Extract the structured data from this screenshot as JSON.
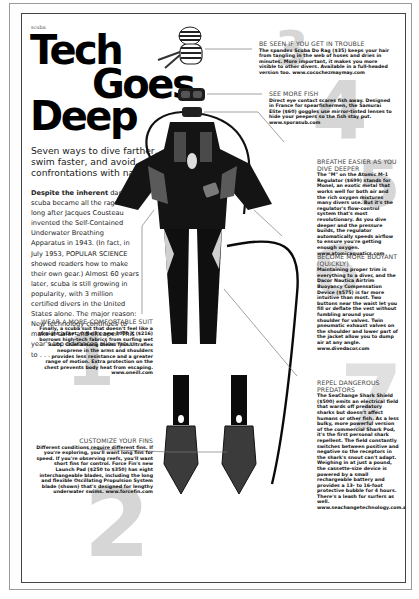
{
  "page": {
    "kicker": "scuba",
    "title_lines": [
      "Tech",
      "Goes",
      "Deep"
    ],
    "deck": "Seven ways to dive farther, swim faster, and avoid confrontations with nature.",
    "intro": {
      "lead": "Despite the inherent",
      "body": " danger, scuba became all the rage not long after Jacques Cousteau invented the Self-Contained Underwater Breathing Apparatus in 1943. (In fact, in July 1953, POPULAR SCIENCE showed readers how to make their own gear.) Almost 60 years later, scuba is still growing in popularity, with 3 million certified divers in the United States alone. The major reason: New technology continues to make it safer and cheaper. This year's top advances allow you to . . ."
    }
  },
  "items": [
    {
      "number": "1",
      "heading": "Wear a more comfortable suit",
      "copy": "Finally, a scuba suit that doesn't feel like a straight jacket. O'Neill's new 3000 X ($216) borrows high-tech fabrics from surfing wet suits. Chief among them: Thin Ultraflex neoprene in the arms and shoulders provides less resistance and a greater range of motion. Extra protection on the chest prevents body heat from escaping. www.oneill.com"
    },
    {
      "number": "2",
      "heading": "Customize your fins",
      "copy": "Different conditions require different fins. If you're exploring, you'll want long fins for speed. If you're observing reefs, you'll want short fins for control. Force Fin's new Launch Pad ($250 to $350) has eight interchangeable blades, including the long and flexible Oscillating Propulsion System blade (shown) that's designed for lengthy underwater swims. www.forcefin.com"
    },
    {
      "number": "3",
      "heading": "Be seen if you get in trouble",
      "copy": "The spandex Scuba Do Rag ($35) keeps your hair from tangling in the web of hoses and dries in minutes. More important, it makes you more visible to other divers. Available in a full-headed version too. www.cocochezmaymay.com"
    },
    {
      "number": "4",
      "heading": "See more fish",
      "copy": "Direct eye contact scares fish away. Designed in France for spearfishermen, the Samurai Elite ($60) goggles use mirror-tinted lenses to hide your peepers so the fish stay put. www.sporasub.com"
    },
    {
      "number": "5",
      "heading": "Breathe easier as you dive deeper",
      "copy": "The \"M\" on the Atomic M-1 Regulator ($699) stands for Monel, an exotic metal that works well for both air and the rich oxygen mixtures many divers use. But it's the regulator's flow-control system that's most revolutionary. As you dive deeper and the pressure builds, the regulator automatically speeds airflow to ensure you're getting enough oxygen. www.atomicaquatics.com"
    },
    {
      "number": "6",
      "heading": "Become more buoyant (quickly)",
      "copy": "Maintaining proper trim is everything to a diver, and the Dacor Nautica Airtrim Buoyancy Compensation Device ($575) is far more intuitive than most. Two buttons near the waist let you fill or deflate the vest without fumbling around your shoulder for valves. Twin pneumatic exhaust valves on the shoulder and lower part of the jacket allow you to dump air at any angle. www.divedacor.com"
    },
    {
      "number": "7",
      "heading": "Repel dangerous predators",
      "copy": "The SeaChange Shark Shield ($500) emits an electrical field that wards off predatory sharks but doesn't affect humans or other fish. As a less bulky, more powerful version of the commercial Shark Pod, it's the first personal shark repellent. The field constantly switches between positive and negative so the receptors in the shark's snout can't adapt. Weighing in at just a pound, the cassette-size device is powered by a small rechargeable battery and provides a 13- to 16-foot protective bubble for 4 hours. There's a leash for surfers as well. www.seachangetechnology.com.au"
    }
  ],
  "illustration": {
    "subject": "diver-gear-figure",
    "parts": [
      "do-rag",
      "goggles",
      "regulator",
      "bcd-vest",
      "wetsuit",
      "fins",
      "shark-shield-cable"
    ]
  },
  "colors": {
    "ink": "#111111",
    "numeral_gray": "#d6d6d6",
    "heading_gray": "#444444",
    "border": "#444444"
  }
}
